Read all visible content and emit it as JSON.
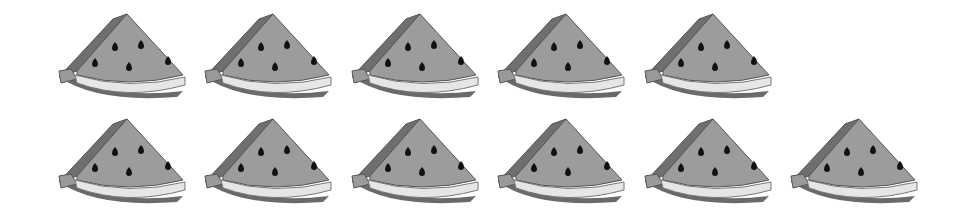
{
  "scene": {
    "description": "Counting picture of watermelon slices",
    "item_name": "watermelon slice",
    "total_count": 11,
    "colors": {
      "background": "#ffffff",
      "flesh": "#9c9c9c",
      "side": "#6f6f6f",
      "rind": "#e6e6e6",
      "rind_edge": "#8a8a8a",
      "seed": "#111111",
      "outline": "#555555"
    }
  },
  "rows": [
    {
      "count": 5,
      "top": 13,
      "items": [
        {
          "left": 57
        },
        {
          "left": 203
        },
        {
          "left": 350
        },
        {
          "left": 496
        },
        {
          "left": 643
        }
      ]
    },
    {
      "count": 6,
      "top": 118,
      "items": [
        {
          "left": 57
        },
        {
          "left": 203
        },
        {
          "left": 350
        },
        {
          "left": 496
        },
        {
          "left": 643
        },
        {
          "left": 789
        }
      ]
    }
  ]
}
